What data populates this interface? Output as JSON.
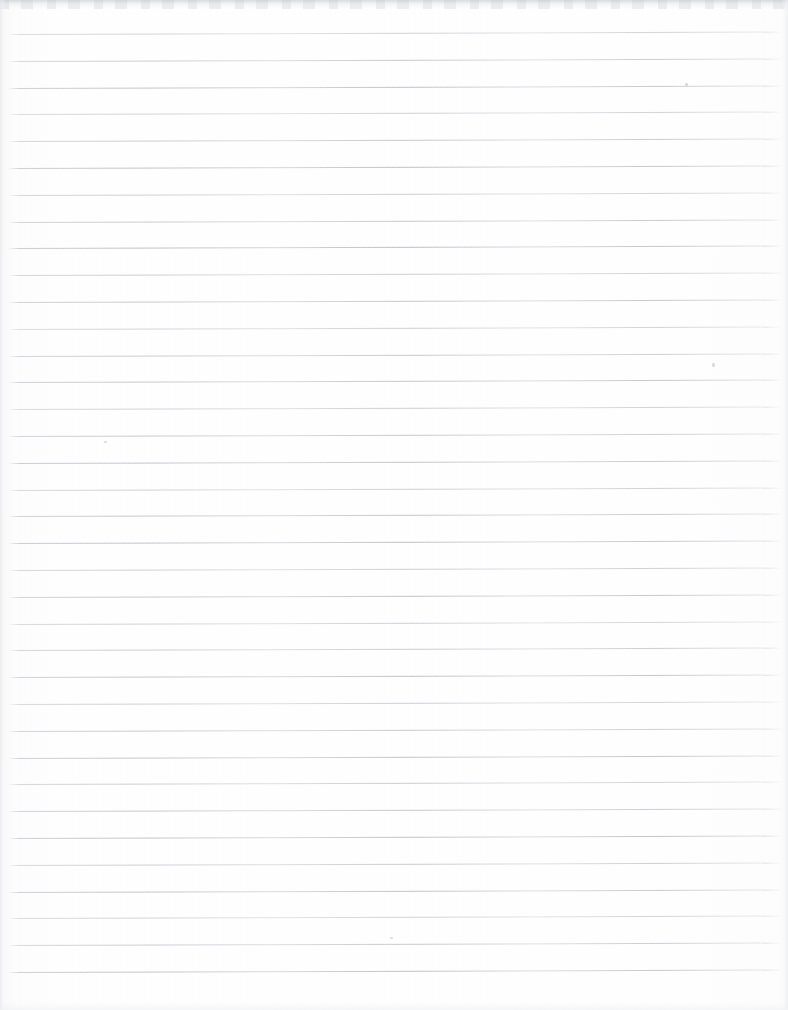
{
  "document": {
    "kind": "scanned-lined-notebook-paper",
    "title": "",
    "written_text": "",
    "page_width": 788,
    "page_height": 1010
  },
  "paper": {
    "background_color": "#fefefe",
    "rule_color": "#b4b9c2",
    "rule_count": 36,
    "first_rule_y": 34,
    "rule_spacing": 26.8,
    "rule_left_x": 8,
    "rule_right_x": 783,
    "rule_slant_px": -2.5,
    "margin_rule": "none",
    "holes": "none"
  },
  "scan_artifacts": {
    "top_edge_band": true,
    "left_edge_shading": true,
    "right_edge_shading": true,
    "bottom_edge_shading": true,
    "specks": [
      {
        "x": 685,
        "y": 83,
        "w": 3,
        "h": 3
      },
      {
        "x": 712,
        "y": 363,
        "w": 3,
        "h": 4
      },
      {
        "x": 104,
        "y": 441,
        "w": 3,
        "h": 2
      },
      {
        "x": 390,
        "y": 937,
        "w": 3,
        "h": 2
      }
    ]
  }
}
